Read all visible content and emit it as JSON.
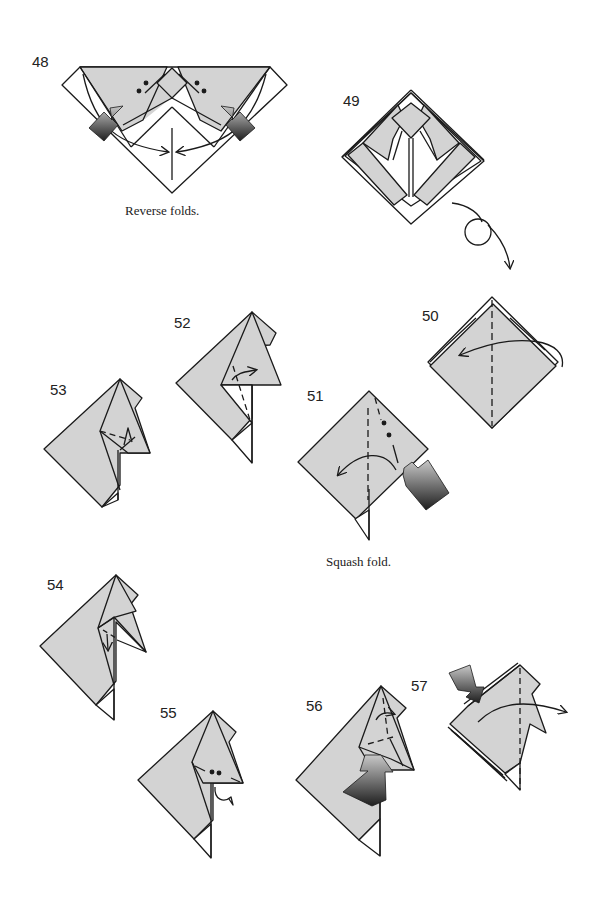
{
  "colors": {
    "paper": "#d3d3d3",
    "line": "#1a1a1a",
    "white": "#ffffff",
    "arrow_dark": "#2a2a2a",
    "arrow_light": "#b5b5b5"
  },
  "steps": [
    {
      "number": "48",
      "caption": "Reverse folds."
    },
    {
      "number": "49",
      "caption": ""
    },
    {
      "number": "50",
      "caption": ""
    },
    {
      "number": "51",
      "caption": "Squash fold."
    },
    {
      "number": "52",
      "caption": ""
    },
    {
      "number": "53",
      "caption": ""
    },
    {
      "number": "54",
      "caption": ""
    },
    {
      "number": "55",
      "caption": ""
    },
    {
      "number": "56",
      "caption": ""
    },
    {
      "number": "57",
      "caption": ""
    }
  ],
  "symbols": {
    "turn_over": "turn-over-icon",
    "push_arrow": "push-arrow-icon",
    "fold_arrow": "fold-arrow-icon",
    "valley_line": "valley-fold-line",
    "reference_dots": "reference-dots"
  }
}
